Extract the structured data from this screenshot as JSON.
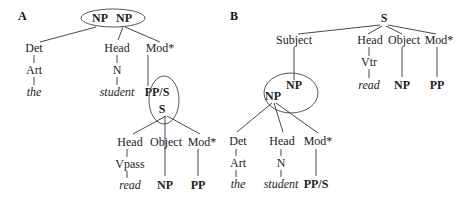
{
  "panels": {
    "A": {
      "label": "A",
      "root_left": "NP",
      "root_right": "NP",
      "det": "Det",
      "art": "Art",
      "the": "the",
      "head": "Head",
      "n": "N",
      "student": "student",
      "mod": "Mod*",
      "ppS": "PP/S",
      "s": "S",
      "sub_head": "Head",
      "vpass": "Vpass",
      "read": "read",
      "object": "Object",
      "np": "NP",
      "sub_mod": "Mod*",
      "pp": "PP"
    },
    "B": {
      "label": "B",
      "s": "S",
      "subject": "Subject",
      "head": "Head",
      "vtr": "Vtr",
      "read": "read",
      "object": "Object",
      "np_obj": "NP",
      "mod": "Mod*",
      "pp": "PP",
      "np_upper": "NP",
      "np_lower": "NP",
      "det": "Det",
      "art": "Art",
      "the": "the",
      "sub_head": "Head",
      "n": "N",
      "student": "student",
      "sub_mod": "Mod*",
      "ppS": "PP/S"
    }
  }
}
